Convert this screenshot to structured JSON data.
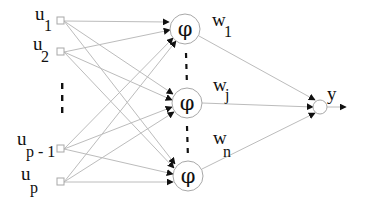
{
  "diagram": {
    "type": "neural-network",
    "inputs": [
      {
        "id": "u1",
        "base": "u",
        "sub": "1",
        "x": 60,
        "y": 21
      },
      {
        "id": "u2",
        "base": "u",
        "sub": "2",
        "x": 60,
        "y": 52
      },
      {
        "id": "up-1",
        "base": "u",
        "sub": "p - 1",
        "x": 60,
        "y": 149
      },
      {
        "id": "up",
        "base": "u",
        "sub": "p",
        "x": 60,
        "y": 182
      }
    ],
    "input_ellipsis": "⋮",
    "hidden": [
      {
        "id": "h1",
        "symbol": "φ",
        "cx": 185,
        "cy": 29,
        "r": 15
      },
      {
        "id": "hj",
        "symbol": "φ",
        "cx": 187,
        "cy": 103,
        "r": 15
      },
      {
        "id": "hn",
        "symbol": "φ",
        "cx": 188,
        "cy": 176,
        "r": 15
      }
    ],
    "weights": [
      {
        "id": "w1",
        "base": "w",
        "sub": "1"
      },
      {
        "id": "wj",
        "base": "w",
        "sub": "j"
      },
      {
        "id": "wn",
        "base": "w",
        "sub": "n"
      }
    ],
    "output": {
      "id": "y",
      "label": "y",
      "cx": 320,
      "cy": 107,
      "r": 7
    },
    "colors": {
      "edge": "#bcbcbc",
      "node_stroke": "#a8a8a8",
      "text": "#111111",
      "background": "#ffffff"
    }
  }
}
